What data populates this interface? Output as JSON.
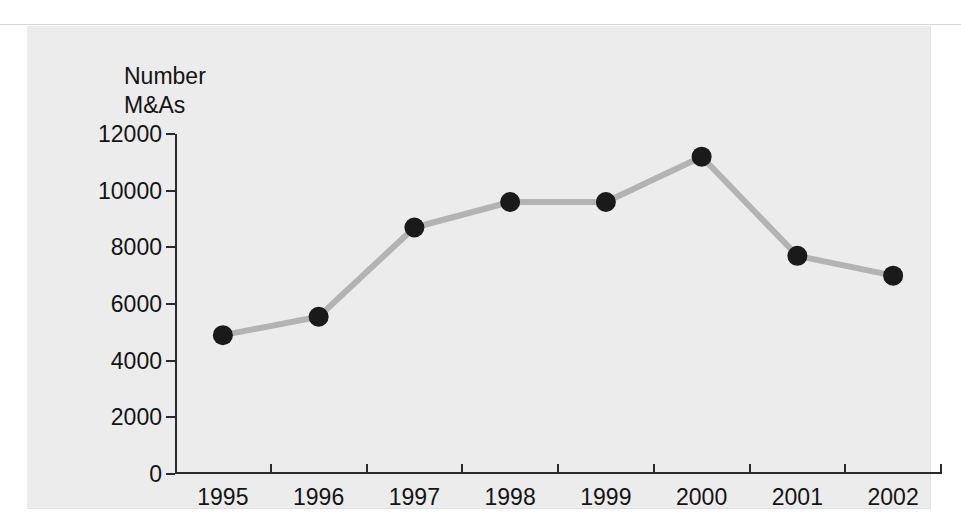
{
  "figure": {
    "axis_title_line1": "Number",
    "axis_title_line2": "M&As",
    "background_color": "#ececec",
    "page_color": "#ffffff"
  },
  "chart_data": {
    "type": "line",
    "title": "",
    "subtitle": "",
    "xlabel": "",
    "ylabel": "Number M&As",
    "categories": [
      "1995",
      "1996",
      "1997",
      "1998",
      "1999",
      "2000",
      "2001",
      "2002"
    ],
    "values": [
      4900,
      5550,
      8700,
      9600,
      9600,
      11200,
      7700,
      7000
    ],
    "series": [
      {
        "name": "Number of M&As",
        "values": [
          4900,
          5550,
          8700,
          9600,
          9600,
          11200,
          7700,
          7000
        ],
        "line_color": "#b3b3b3",
        "marker_color": "#1a1a1a",
        "line_width": 6,
        "marker_radius": 10
      }
    ],
    "ylim": [
      0,
      12000
    ],
    "ytick_labels": [
      "0",
      "2000",
      "4000",
      "6000",
      "8000",
      "10000",
      "12000"
    ],
    "ytick_values": [
      0,
      2000,
      4000,
      6000,
      8000,
      10000,
      12000
    ],
    "xtick_labels": [
      "1995",
      "1996",
      "1997",
      "1998",
      "1999",
      "2000",
      "2001",
      "2002"
    ],
    "grid": false,
    "legend": false,
    "legend_position": "none"
  }
}
